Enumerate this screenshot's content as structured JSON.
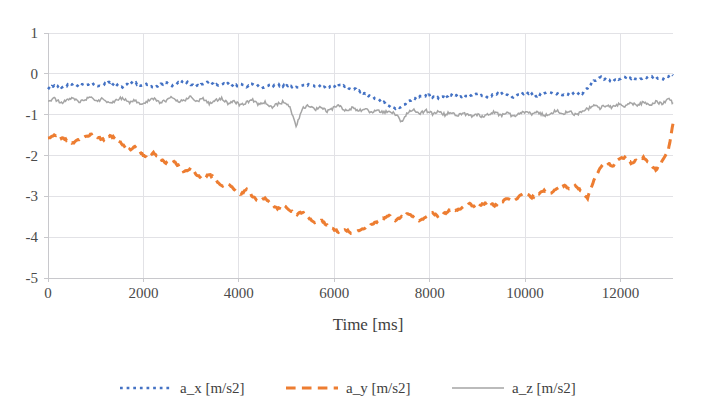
{
  "chart_data": {
    "type": "line",
    "title": "",
    "subtitle": "",
    "xlabel": "Time [ms]",
    "ylabel": "",
    "xlim": [
      0,
      13100
    ],
    "ylim": [
      -5,
      1
    ],
    "xticks": [
      0,
      2000,
      4000,
      6000,
      8000,
      10000,
      12000
    ],
    "xticklabels": [
      "0",
      "2000",
      "4000",
      "6000",
      "8000",
      "10000",
      "12000"
    ],
    "yticks": [
      1,
      0,
      -1,
      -2,
      -3,
      -4,
      -5
    ],
    "yticklabels": [
      "1",
      "0",
      "-1",
      "-2",
      "-3",
      "-4",
      "-5"
    ],
    "grid": true,
    "grid_axis": "both",
    "legend_position": "bottom",
    "colors": {
      "a_x": "#4472C4",
      "a_y": "#ED7D31",
      "a_z": "#A5A5A5",
      "grid": "#E2E2E6",
      "axis": "#C8C8CC",
      "text": "#3F3F3F",
      "background": "#FFFFFF"
    },
    "linestyles": {
      "a_x": "dotted",
      "a_y": "dashed",
      "a_z": "solid"
    },
    "series": [
      {
        "name": "a_x [m/s2]",
        "color": "#4472C4",
        "style": "dotted",
        "x": [
          0,
          130,
          260,
          390,
          520,
          650,
          780,
          910,
          1040,
          1170,
          1300,
          1430,
          1560,
          1690,
          1820,
          1950,
          2080,
          2210,
          2340,
          2470,
          2600,
          2730,
          2860,
          2990,
          3120,
          3250,
          3380,
          3510,
          3640,
          3770,
          3900,
          4030,
          4160,
          4290,
          4420,
          4550,
          4680,
          4810,
          4940,
          5070,
          5200,
          5330,
          5460,
          5590,
          5720,
          5850,
          5980,
          6110,
          6240,
          6370,
          6500,
          6630,
          6760,
          6890,
          7020,
          7150,
          7280,
          7410,
          7540,
          7670,
          7800,
          7930,
          8060,
          8190,
          8320,
          8450,
          8580,
          8710,
          8840,
          8970,
          9100,
          9230,
          9360,
          9490,
          9620,
          9750,
          9880,
          10010,
          10140,
          10270,
          10400,
          10530,
          10660,
          10790,
          10920,
          11050,
          11180,
          11310,
          11440,
          11570,
          11700,
          11830,
          11960,
          12090,
          12220,
          12350,
          12480,
          12610,
          12740,
          12870,
          13000,
          13100
        ],
        "y": [
          -0.38,
          -0.3,
          -0.33,
          -0.28,
          -0.24,
          -0.3,
          -0.26,
          -0.22,
          -0.31,
          -0.27,
          -0.19,
          -0.28,
          -0.33,
          -0.24,
          -0.22,
          -0.3,
          -0.25,
          -0.34,
          -0.26,
          -0.21,
          -0.29,
          -0.23,
          -0.17,
          -0.26,
          -0.31,
          -0.24,
          -0.2,
          -0.28,
          -0.26,
          -0.22,
          -0.3,
          -0.27,
          -0.31,
          -0.25,
          -0.29,
          -0.33,
          -0.28,
          -0.26,
          -0.31,
          -0.29,
          -0.34,
          -0.3,
          -0.27,
          -0.32,
          -0.29,
          -0.35,
          -0.31,
          -0.28,
          -0.33,
          -0.36,
          -0.41,
          -0.47,
          -0.55,
          -0.62,
          -0.7,
          -0.78,
          -0.86,
          -0.8,
          -0.7,
          -0.6,
          -0.55,
          -0.52,
          -0.56,
          -0.6,
          -0.55,
          -0.5,
          -0.54,
          -0.58,
          -0.52,
          -0.48,
          -0.53,
          -0.57,
          -0.51,
          -0.47,
          -0.52,
          -0.56,
          -0.5,
          -0.46,
          -0.51,
          -0.55,
          -0.49,
          -0.45,
          -0.5,
          -0.54,
          -0.48,
          -0.44,
          -0.49,
          -0.35,
          -0.18,
          -0.08,
          -0.14,
          -0.2,
          -0.12,
          -0.06,
          -0.1,
          -0.16,
          -0.1,
          -0.05,
          -0.08,
          -0.12,
          -0.06,
          -0.04
        ]
      },
      {
        "name": "a_y [m/s2]",
        "color": "#ED7D31",
        "style": "dashed",
        "x": [
          0,
          130,
          260,
          390,
          520,
          650,
          780,
          910,
          1040,
          1170,
          1300,
          1430,
          1560,
          1690,
          1820,
          1950,
          2080,
          2210,
          2340,
          2470,
          2600,
          2730,
          2860,
          2990,
          3120,
          3250,
          3380,
          3510,
          3640,
          3770,
          3900,
          4030,
          4160,
          4290,
          4420,
          4550,
          4680,
          4810,
          4940,
          5070,
          5200,
          5330,
          5460,
          5590,
          5720,
          5850,
          5980,
          6110,
          6240,
          6370,
          6500,
          6630,
          6760,
          6890,
          7020,
          7150,
          7280,
          7410,
          7540,
          7670,
          7800,
          7930,
          8060,
          8190,
          8320,
          8450,
          8580,
          8710,
          8840,
          8970,
          9100,
          9230,
          9360,
          9490,
          9620,
          9750,
          9880,
          10010,
          10140,
          10270,
          10400,
          10530,
          10660,
          10790,
          10920,
          11050,
          11180,
          11310,
          11440,
          11570,
          11700,
          11830,
          11960,
          12090,
          12220,
          12350,
          12480,
          12610,
          12740,
          12870,
          13000,
          13100
        ],
        "y": [
          -1.58,
          -1.5,
          -1.55,
          -1.62,
          -1.7,
          -1.6,
          -1.55,
          -1.48,
          -1.55,
          -1.62,
          -1.52,
          -1.58,
          -1.72,
          -1.88,
          -1.8,
          -1.95,
          -2.05,
          -1.92,
          -2.08,
          -2.18,
          -2.1,
          -2.25,
          -2.4,
          -2.3,
          -2.48,
          -2.58,
          -2.45,
          -2.6,
          -2.75,
          -2.68,
          -2.82,
          -2.95,
          -2.85,
          -3.0,
          -3.12,
          -3.05,
          -3.18,
          -3.3,
          -3.22,
          -3.35,
          -3.45,
          -3.38,
          -3.52,
          -3.65,
          -3.58,
          -3.72,
          -3.8,
          -3.88,
          -3.82,
          -3.9,
          -3.85,
          -3.78,
          -3.7,
          -3.62,
          -3.55,
          -3.48,
          -3.58,
          -3.5,
          -3.42,
          -3.52,
          -3.6,
          -3.48,
          -3.4,
          -3.5,
          -3.42,
          -3.3,
          -3.35,
          -3.25,
          -3.18,
          -3.28,
          -3.2,
          -3.12,
          -3.22,
          -3.15,
          -3.05,
          -3.12,
          -3.0,
          -2.92,
          -3.02,
          -2.95,
          -2.85,
          -2.92,
          -2.8,
          -2.72,
          -2.82,
          -2.75,
          -2.88,
          -3.05,
          -2.6,
          -2.3,
          -2.15,
          -2.28,
          -2.1,
          -2.05,
          -2.18,
          -2.12,
          -2.05,
          -2.2,
          -2.35,
          -2.15,
          -1.9,
          -1.22
        ]
      },
      {
        "name": "a_z [m/s2]",
        "color": "#A5A5A5",
        "style": "solid",
        "x": [
          0,
          130,
          260,
          390,
          520,
          650,
          780,
          910,
          1040,
          1170,
          1300,
          1430,
          1560,
          1690,
          1820,
          1950,
          2080,
          2210,
          2340,
          2470,
          2600,
          2730,
          2860,
          2990,
          3120,
          3250,
          3380,
          3510,
          3640,
          3770,
          3900,
          4030,
          4160,
          4290,
          4420,
          4550,
          4680,
          4810,
          4940,
          5070,
          5200,
          5330,
          5460,
          5590,
          5720,
          5850,
          5980,
          6110,
          6240,
          6370,
          6500,
          6630,
          6760,
          6890,
          7020,
          7150,
          7280,
          7410,
          7540,
          7670,
          7800,
          7930,
          8060,
          8190,
          8320,
          8450,
          8580,
          8710,
          8840,
          8970,
          9100,
          9230,
          9360,
          9490,
          9620,
          9750,
          9880,
          10010,
          10140,
          10270,
          10400,
          10530,
          10660,
          10790,
          10920,
          11050,
          11180,
          11310,
          11440,
          11570,
          11700,
          11830,
          11960,
          12090,
          12220,
          12350,
          12480,
          12610,
          12740,
          12870,
          13000,
          13100
        ],
        "y": [
          -0.66,
          -0.6,
          -0.72,
          -0.64,
          -0.58,
          -0.7,
          -0.62,
          -0.55,
          -0.68,
          -0.6,
          -0.74,
          -0.66,
          -0.58,
          -0.7,
          -0.64,
          -0.76,
          -0.68,
          -0.6,
          -0.72,
          -0.66,
          -0.58,
          -0.7,
          -0.64,
          -0.56,
          -0.68,
          -0.62,
          -0.74,
          -0.66,
          -0.6,
          -0.72,
          -0.66,
          -0.78,
          -0.7,
          -0.64,
          -0.76,
          -0.7,
          -0.82,
          -0.74,
          -0.68,
          -0.8,
          -1.3,
          -0.85,
          -0.76,
          -0.88,
          -0.8,
          -0.92,
          -0.84,
          -0.78,
          -0.9,
          -0.84,
          -0.92,
          -0.86,
          -0.94,
          -0.88,
          -0.96,
          -0.9,
          -0.98,
          -1.18,
          -0.95,
          -0.88,
          -0.96,
          -0.9,
          -0.98,
          -0.92,
          -1.0,
          -0.94,
          -1.02,
          -0.96,
          -1.04,
          -0.98,
          -1.06,
          -1.0,
          -0.94,
          -1.02,
          -0.96,
          -1.04,
          -0.98,
          -0.92,
          -1.0,
          -0.94,
          -1.02,
          -0.96,
          -0.9,
          -0.98,
          -0.92,
          -1.0,
          -0.94,
          -0.86,
          -0.78,
          -0.84,
          -0.76,
          -0.82,
          -0.74,
          -0.8,
          -0.72,
          -0.78,
          -0.7,
          -0.76,
          -0.68,
          -0.74,
          -0.62,
          -0.7
        ]
      }
    ]
  },
  "legend": {
    "items": [
      {
        "label": "a_x [m/s2]",
        "color": "#4472C4",
        "style": "dotted"
      },
      {
        "label": "a_y [m/s2]",
        "color": "#ED7D31",
        "style": "dashed"
      },
      {
        "label": "a_z [m/s2]",
        "color": "#A5A5A5",
        "style": "solid"
      }
    ]
  }
}
